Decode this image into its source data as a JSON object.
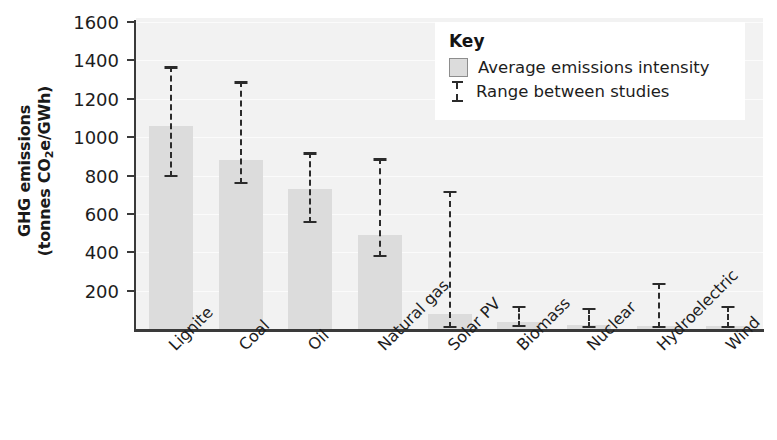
{
  "chart_data": {
    "type": "bar",
    "title": "",
    "xlabel": "",
    "ylabel_line1": "GHG emissions",
    "ylabel_line2_pre": "(tonnes CO",
    "ylabel_line2_sub": "2",
    "ylabel_line2_post": "e/GWh)",
    "categories": [
      "Lignite",
      "Coal",
      "Oil",
      "Natural gas",
      "Solar PV",
      "Biomass",
      "Nuclear",
      "Hydroelectric",
      "Wind"
    ],
    "values": [
      1070,
      890,
      740,
      500,
      90,
      45,
      30,
      25,
      25
    ],
    "range_low": [
      790,
      755,
      550,
      375,
      5,
      10,
      5,
      5,
      5
    ],
    "range_high": [
      1370,
      1290,
      920,
      890,
      720,
      120,
      110,
      240,
      120
    ],
    "series": [
      {
        "name": "Average emissions intensity",
        "values": [
          1070,
          890,
          740,
          500,
          90,
          45,
          30,
          25,
          25
        ]
      }
    ],
    "yticks": [
      200,
      400,
      600,
      800,
      1000,
      1200,
      1400,
      1600
    ],
    "ylim": [
      0,
      1600
    ],
    "grid": true,
    "legend_position": "top-right",
    "bar_color": "#dcdcdc",
    "errorbar_color": "#2b2b2b",
    "plot_background": "#f2f2f2"
  },
  "legend": {
    "title": "Key",
    "items": [
      {
        "label": "Average emissions intensity",
        "marker": "swatch"
      },
      {
        "label": "Range between studies",
        "marker": "errorbar"
      }
    ]
  }
}
